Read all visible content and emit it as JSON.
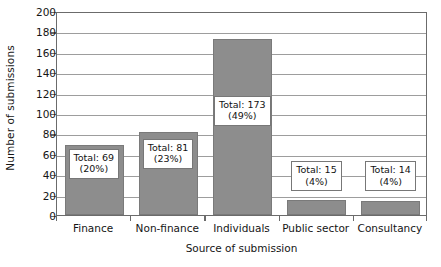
{
  "chart_data": {
    "type": "bar",
    "title": "",
    "xlabel": "Source of submission",
    "ylabel": "Number of submissions",
    "categories": [
      "Finance",
      "Non-finance",
      "Individuals",
      "Public sector",
      "Consultancy"
    ],
    "values": [
      69,
      81,
      173,
      15,
      14
    ],
    "percentages": [
      "20%",
      "23%",
      "49%",
      "4%",
      "4%"
    ],
    "point_labels": [
      {
        "line1": "Total: 69",
        "line2": "(20%)"
      },
      {
        "line1": "Total: 81",
        "line2": "(23%)"
      },
      {
        "line1": "Total: 173",
        "line2": "(49%)"
      },
      {
        "line1": "Total: 15",
        "line2": "(4%)"
      },
      {
        "line1": "Total: 14",
        "line2": "(4%)"
      }
    ],
    "ylim": [
      0,
      200
    ],
    "yticks": [
      0,
      20,
      40,
      60,
      80,
      100,
      120,
      140,
      160,
      180,
      200
    ],
    "ytick_labels": [
      "0",
      "20",
      "40",
      "60",
      "80",
      "100",
      "120",
      "140",
      "160",
      "180",
      "200"
    ],
    "grid": true,
    "legend": "none",
    "colors": {
      "bar_fill": "#8d8d8d",
      "bar_edge": "#7a7a7a",
      "gridline": "#9d9d9d",
      "axis": "#6b6b6b",
      "label_box_bg": "#ffffff",
      "label_box_border": "#777777",
      "text": "#151515",
      "background": "#ffffff"
    }
  }
}
